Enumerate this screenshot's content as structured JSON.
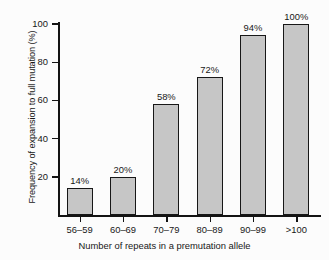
{
  "chart_data": {
    "type": "bar",
    "title": "",
    "xlabel": "Number of repeats in a premutation allele",
    "ylabel": "Frequency of expansion to full mutation (%)",
    "categories": [
      "56–59",
      "60–69",
      "70–79",
      "80–89",
      "90–99",
      ">100"
    ],
    "values": [
      14,
      20,
      58,
      72,
      94,
      100
    ],
    "value_labels": [
      "14%",
      "20%",
      "58%",
      "72%",
      "94%",
      "100%"
    ],
    "ylim": [
      0,
      100
    ],
    "yticks": [
      20,
      40,
      60,
      80,
      100
    ],
    "ytick_labels": [
      "20",
      "40",
      "60",
      "80",
      "100"
    ],
    "grid": false,
    "legend": false,
    "legend_position": "none",
    "bar_fill_color": "#c6c6c6",
    "bar_border_color": "#171717",
    "axis_color": "#141414",
    "background_color": "#fcfcfc",
    "text_color": "#181818"
  },
  "axes": {
    "x_title": "Number of repeats in a premutation allele",
    "y_title": "Frequency of expansion to full mutation (%)"
  }
}
